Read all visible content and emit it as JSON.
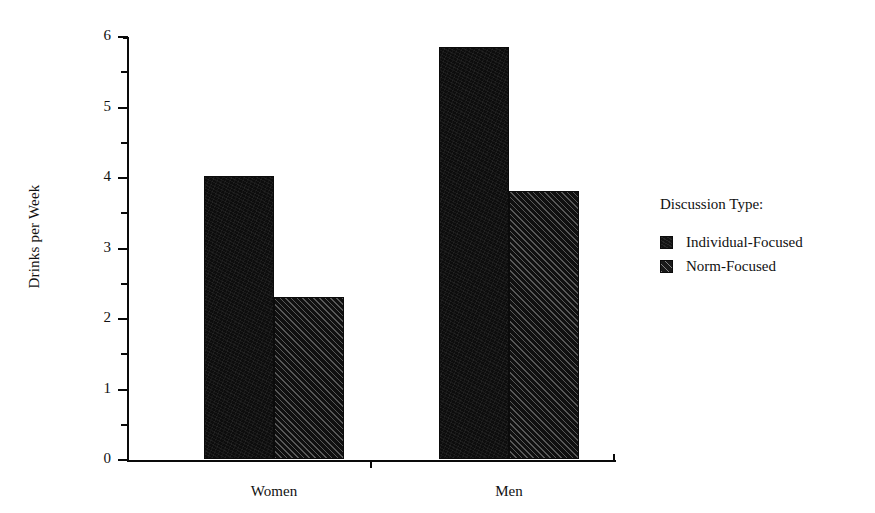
{
  "chart_data": {
    "type": "bar",
    "title": "",
    "xlabel": "",
    "ylabel": "Drinks per Week",
    "categories": [
      "Women",
      "Men"
    ],
    "series": [
      {
        "name": "Individual-Focused",
        "pattern": "solid",
        "values": [
          4.02,
          5.85
        ]
      },
      {
        "name": "Norm-Focused",
        "pattern": "diagonal-hatch",
        "values": [
          2.3,
          3.8
        ]
      }
    ],
    "ylim": [
      0,
      6
    ],
    "ytick_labels": [
      "0",
      "1",
      "2",
      "3",
      "4",
      "5",
      "6"
    ],
    "ytick_values": [
      0,
      1,
      2,
      3,
      4,
      5,
      6
    ],
    "yminor_tick_values": [
      0.5,
      1.5,
      2.5,
      3.5,
      4.5,
      5.5
    ],
    "grid": false,
    "legend_position": "right",
    "legend_title": "Discussion Type:",
    "colors": {
      "ink": "#0d0d0d",
      "background": "#ffffff",
      "axis": "#0a0a0a"
    }
  },
  "legend": {
    "title": "Discussion Type:",
    "entries": [
      {
        "label": "Individual-Focused",
        "swatch": "solid-swatch-icon"
      },
      {
        "label": "Norm-Focused",
        "swatch": "hatched-swatch-icon"
      }
    ]
  },
  "axes": {
    "y_label": "Drinks per Week",
    "y_ticks": [
      {
        "label": "6",
        "value": 6
      },
      {
        "label": "5",
        "value": 5
      },
      {
        "label": "4",
        "value": 4
      },
      {
        "label": "3",
        "value": 3
      },
      {
        "label": "2",
        "value": 2
      },
      {
        "label": "1",
        "value": 1
      },
      {
        "label": "0",
        "value": 0
      }
    ],
    "x_categories": [
      {
        "label": "Women"
      },
      {
        "label": "Men"
      }
    ]
  }
}
